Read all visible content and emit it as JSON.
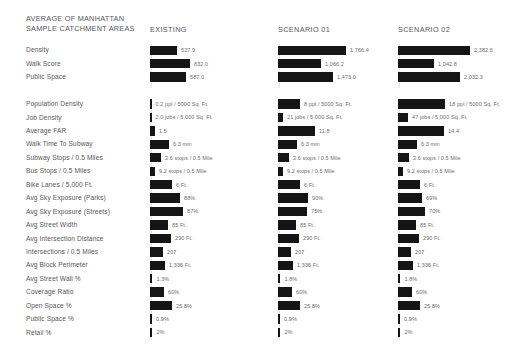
{
  "header": {
    "title": "AVERAGE OF MANHATTAN\nSAMPLE CATCHMENT AREAS",
    "columns": [
      {
        "label": "EXISTING",
        "x": 150
      },
      {
        "label": "SCENARIO 01",
        "x": 278
      },
      {
        "label": "SCENARIO 02",
        "x": 398
      }
    ]
  },
  "chart_data": {
    "type": "bar",
    "title": "AVERAGE OF MANHATTAN SAMPLE CATCHMENT AREAS",
    "xlabel": "",
    "ylabel": "",
    "legend_position": "top",
    "grid": true,
    "orientation": "horizontal",
    "series": [
      "EXISTING",
      "SCENARIO 01",
      "SCENARIO 02"
    ],
    "groups": [
      {
        "name": "summary",
        "categories": [
          "Density",
          "Walk Score",
          "Public Space"
        ],
        "rows": [
          {
            "label": "Density",
            "cells": [
              {
                "value": 527.9,
                "display": "527.9",
                "w": 27
              },
              {
                "value": 1766.4,
                "display": "1,766.4",
                "w": 68
              },
              {
                "value": 2382.6,
                "display": "2,382.6",
                "w": 72
              }
            ]
          },
          {
            "label": "Walk Score",
            "cells": [
              {
                "value": 832.0,
                "display": "832.0",
                "w": 40
              },
              {
                "value": 1066.2,
                "display": "1,066.2",
                "w": 43
              },
              {
                "value": 1042.8,
                "display": "1,042.8",
                "w": 36
              }
            ]
          },
          {
            "label": "Public Space",
            "cells": [
              {
                "value": 587.0,
                "display": "587.0",
                "w": 36
              },
              {
                "value": 1473.0,
                "display": "1,473.0",
                "w": 55
              },
              {
                "value": 2032.3,
                "display": "2,032.3",
                "w": 62
              }
            ]
          }
        ]
      },
      {
        "name": "metrics",
        "rows": [
          {
            "label": "Population Density",
            "cells": [
              {
                "value": 0.2,
                "display": "0.2 ppl / 5000 Sq. Ft.",
                "w": 1.6
              },
              {
                "value": 8,
                "display": "8 ppl / 5000 Sq. Ft.",
                "w": 22
              },
              {
                "value": 18,
                "display": "18 ppl / 5000 Sq. Ft.",
                "w": 47
              }
            ]
          },
          {
            "label": "Job Density",
            "cells": [
              {
                "value": 2.0,
                "display": "2.0 jobs / 5,000 Sq. Ft.",
                "w": 1.6
              },
              {
                "value": 21,
                "display": "21 jobs / 5,000 Sq. Ft.",
                "w": 5
              },
              {
                "value": 47,
                "display": "47 jobs / 5,000 Sq. Ft.",
                "w": 10
              }
            ]
          },
          {
            "label": "Average FAR",
            "cells": [
              {
                "value": 1.5,
                "display": "1.5",
                "w": 5
              },
              {
                "value": 11.8,
                "display": "11.8",
                "w": 37
              },
              {
                "value": 14.4,
                "display": "14.4",
                "w": 46
              }
            ]
          },
          {
            "label": "Walk Time To Subway",
            "cells": [
              {
                "value": 6.3,
                "display": "6.3 min",
                "w": 19
              },
              {
                "value": 6.3,
                "display": "6.3 min",
                "w": 19
              },
              {
                "value": 6.3,
                "display": "6.3 min",
                "w": 19
              }
            ]
          },
          {
            "label": "Subway Stops / 0.5 Miles",
            "cells": [
              {
                "value": 2.6,
                "display": "2.6 stops / 0.5 Mile",
                "w": 11
              },
              {
                "value": 2.6,
                "display": "2.6 stops / 0.5 Mile",
                "w": 11
              },
              {
                "value": 2.6,
                "display": "2.6 stops / 0.5 Mile",
                "w": 11
              }
            ]
          },
          {
            "label": "Bus Stops / 0.5 Miles",
            "cells": [
              {
                "value": 9.2,
                "display": "9.2 stops / 0.5 Mile",
                "w": 5
              },
              {
                "value": 9.2,
                "display": "9.2 stops / 0.5 Mile",
                "w": 5
              },
              {
                "value": 9.2,
                "display": "9.2 stops / 0.5 Mile",
                "w": 5
              }
            ]
          },
          {
            "label": "Bike Lanes / 5,000 Ft.",
            "cells": [
              {
                "value": 6,
                "display": "6 Ft.",
                "w": 22
              },
              {
                "value": 6,
                "display": "6 Ft.",
                "w": 22
              },
              {
                "value": 6,
                "display": "6 Ft.",
                "w": 22
              }
            ]
          },
          {
            "label": "Avg Sky Exposure (Parks)",
            "cells": [
              {
                "value": 88,
                "display": "88%",
                "w": 30
              },
              {
                "value": 90,
                "display": "90%",
                "w": 30
              },
              {
                "value": 69,
                "display": "69%",
                "w": 24
              }
            ]
          },
          {
            "label": "Avg Sky Exposure (Streets)",
            "cells": [
              {
                "value": 87,
                "display": "87%",
                "w": 33
              },
              {
                "value": 75,
                "display": "75%",
                "w": 29
              },
              {
                "value": 70,
                "display": "70%",
                "w": 27
              }
            ]
          },
          {
            "label": "Avg Street Width",
            "cells": [
              {
                "value": 85,
                "display": "85 Ft.",
                "w": 18
              },
              {
                "value": 85,
                "display": "85 Ft.",
                "w": 18
              },
              {
                "value": 85,
                "display": "85 Ft.",
                "w": 18
              }
            ]
          },
          {
            "label": "Avg Intersection Distance",
            "cells": [
              {
                "value": 290,
                "display": "290 Ft.",
                "w": 21
              },
              {
                "value": 290,
                "display": "290 Ft.",
                "w": 21
              },
              {
                "value": 290,
                "display": "290 Ft.",
                "w": 21
              }
            ]
          },
          {
            "label": "Intersections / 0.5 Miles",
            "cells": [
              {
                "value": 207,
                "display": "207",
                "w": 13
              },
              {
                "value": 207,
                "display": "207",
                "w": 13
              },
              {
                "value": 207,
                "display": "207",
                "w": 13
              }
            ]
          },
          {
            "label": "Avg Block Perimeter",
            "cells": [
              {
                "value": 1336,
                "display": "1,336 Ft.",
                "w": 15
              },
              {
                "value": 1336,
                "display": "1,336 Ft.",
                "w": 15
              },
              {
                "value": 1336,
                "display": "1,336 Ft.",
                "w": 15
              }
            ]
          },
          {
            "label": "Avg Street Wall %",
            "cells": [
              {
                "value": 1.3,
                "display": "1.3%",
                "w": 2.4
              },
              {
                "value": 1.8,
                "display": "1.8%",
                "w": 2.4
              },
              {
                "value": 1.8,
                "display": "1.8%",
                "w": 2.4
              }
            ]
          },
          {
            "label": "Coverage Ratio",
            "cells": [
              {
                "value": 60,
                "display": "60%",
                "w": 14
              },
              {
                "value": 60,
                "display": "60%",
                "w": 14
              },
              {
                "value": 60,
                "display": "60%",
                "w": 14
              }
            ]
          },
          {
            "label": "Open Space %",
            "cells": [
              {
                "value": 25.8,
                "display": "25.8%",
                "w": 22
              },
              {
                "value": 25.8,
                "display": "25.8%",
                "w": 22
              },
              {
                "value": 25.8,
                "display": "25.8%",
                "w": 22
              }
            ]
          },
          {
            "label": "Public Space %",
            "cells": [
              {
                "value": 0.9,
                "display": "0.9%",
                "w": 2
              },
              {
                "value": 0.9,
                "display": "0.9%",
                "w": 2
              },
              {
                "value": 0.9,
                "display": "0.9%",
                "w": 2
              }
            ]
          },
          {
            "label": "Retail %",
            "cells": [
              {
                "value": 2,
                "display": "2%",
                "w": 2.4
              },
              {
                "value": 2,
                "display": "2%",
                "w": 2.4
              },
              {
                "value": 2,
                "display": "2%",
                "w": 2.4
              }
            ]
          }
        ]
      }
    ]
  },
  "colors": {
    "bar": "#151515",
    "label": "#575757",
    "value": "#6b6b6b",
    "guide": "#e3e3e3",
    "background": "#ffffff"
  }
}
